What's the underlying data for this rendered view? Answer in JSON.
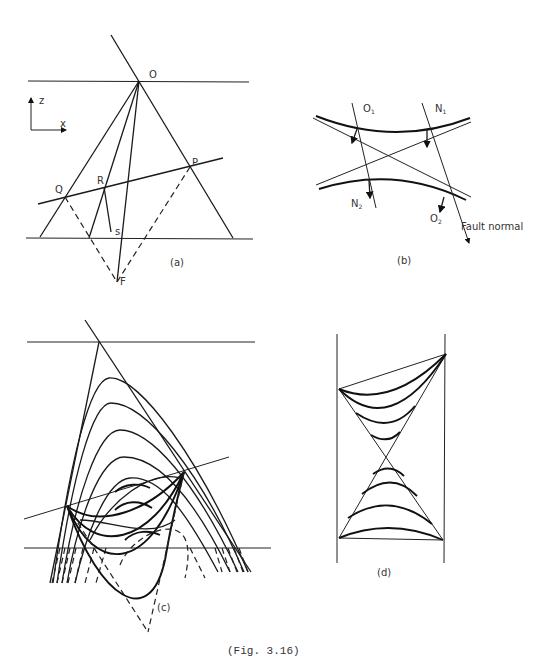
{
  "figure": {
    "caption": "(Fig. 3.16)"
  },
  "panel_a": {
    "label": "(a)",
    "points": {
      "O": "O",
      "P": "P",
      "Q": "Q",
      "R": "R",
      "s": "s",
      "F": "F"
    },
    "axes": {
      "z": "z",
      "x": "x"
    }
  },
  "panel_b": {
    "label": "(b)",
    "labels": {
      "O1": "O",
      "O1_sub": "1",
      "N1": "N",
      "N1_sub": "1",
      "N2": "N",
      "N2_sub": "2",
      "O2": "O",
      "O2_sub": "2"
    },
    "fault_normal": "Fault normal"
  },
  "panel_c": {
    "label": "(c)"
  },
  "panel_d": {
    "label": "(d)"
  }
}
